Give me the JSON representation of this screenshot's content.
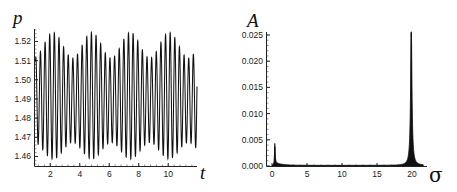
{
  "chart_data": [
    {
      "type": "line",
      "title": "",
      "xlabel": "t",
      "ylabel": "p",
      "xlim": [
        1.0,
        11.95
      ],
      "ylim": [
        1.455,
        1.526
      ],
      "x_ticks": [
        2,
        4,
        6,
        8,
        10
      ],
      "x_tick_labels": [
        "2",
        "4",
        "6",
        "8",
        "10"
      ],
      "y_ticks": [
        1.46,
        1.47,
        1.48,
        1.49,
        1.5,
        1.51,
        1.52
      ],
      "y_tick_labels": [
        "1.46",
        "1.47",
        "1.48",
        "1.49",
        "1.50",
        "1.51",
        "1.52"
      ],
      "grid": false,
      "legend": null,
      "description": "Dense fast oscillation (angular frequency ~20) around p = 1.49 with slow beat envelope; amplitude maxima near t = 2.2, 4.8, 7.4, 10.1",
      "signal": {
        "mean": 1.4905,
        "fast_omega": 20.0,
        "base_amplitude": 0.0275,
        "envelope_amplitude": 0.0055,
        "envelope_period": 2.62,
        "envelope_peak_t": 2.2
      },
      "envelope_maxima": [
        {
          "t": 2.2,
          "p_max": 1.522,
          "p_min": 1.458
        },
        {
          "t": 4.8,
          "p_max": 1.525,
          "p_min": 1.456
        },
        {
          "t": 7.4,
          "p_max": 1.525,
          "p_min": 1.456
        },
        {
          "t": 10.1,
          "p_max": 1.525,
          "p_min": 1.456
        }
      ],
      "envelope_minima": [
        {
          "t": 3.5,
          "p_max": 1.514,
          "p_min": 1.464
        },
        {
          "t": 6.1,
          "p_max": 1.516,
          "p_min": 1.463
        },
        {
          "t": 8.8,
          "p_max": 1.516,
          "p_min": 1.463
        }
      ]
    },
    {
      "type": "line",
      "title": "",
      "xlabel": "σ",
      "ylabel": "A",
      "xlim": [
        -0.5,
        22.0
      ],
      "ylim": [
        0.0,
        0.0265
      ],
      "x_ticks": [
        0,
        5,
        10,
        15,
        20
      ],
      "x_tick_labels": [
        "0",
        "5",
        "10",
        "15",
        "20"
      ],
      "y_ticks": [
        0.0,
        0.005,
        0.01,
        0.015,
        0.02,
        0.025
      ],
      "y_tick_labels": [
        "0.000",
        "0.005",
        "0.010",
        "0.015",
        "0.020",
        "0.025"
      ],
      "grid": false,
      "legend": null,
      "description": "Amplitude spectrum with small low-frequency peak near σ ≈ 0.4 and dominant sharp peak near σ ≈ 20",
      "peaks": [
        {
          "sigma": 0.4,
          "A": 0.0037
        },
        {
          "sigma": 19.9,
          "A": 0.0255
        }
      ],
      "points": [
        {
          "sigma": 0.0,
          "A": 0.0
        },
        {
          "sigma": 0.2,
          "A": 0.0012
        },
        {
          "sigma": 0.4,
          "A": 0.0037
        },
        {
          "sigma": 0.6,
          "A": 0.0012
        },
        {
          "sigma": 1.0,
          "A": 0.0006
        },
        {
          "sigma": 2.0,
          "A": 0.0003
        },
        {
          "sigma": 5.0,
          "A": 0.0001
        },
        {
          "sigma": 10.0,
          "A": 0.0001
        },
        {
          "sigma": 15.0,
          "A": 0.0002
        },
        {
          "sigma": 18.0,
          "A": 0.0006
        },
        {
          "sigma": 19.0,
          "A": 0.0015
        },
        {
          "sigma": 19.6,
          "A": 0.0045
        },
        {
          "sigma": 19.9,
          "A": 0.0255
        },
        {
          "sigma": 20.2,
          "A": 0.0045
        },
        {
          "sigma": 20.8,
          "A": 0.0012
        },
        {
          "sigma": 21.5,
          "A": 0.0004
        }
      ]
    }
  ]
}
